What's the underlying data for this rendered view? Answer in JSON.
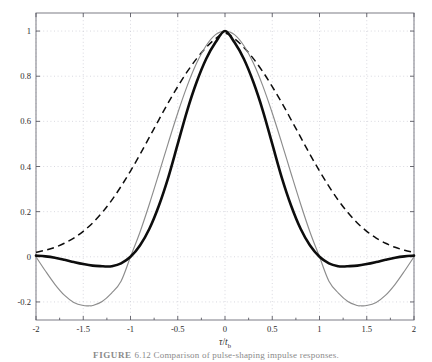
{
  "figure": {
    "caption_prefix": "FIGURE",
    "caption_number": "6.12",
    "caption_text": "Comparison of pulse-shaping impulse responses."
  },
  "axes": {
    "x_title_numerator": "τ",
    "x_title_slash": "/",
    "x_title_denominator": "t",
    "x_title_subscript": "b",
    "y_title": ""
  },
  "chart_data": {
    "type": "line",
    "title": "",
    "xlabel": "τ/t_b",
    "ylabel": "",
    "xlim": [
      -2,
      2
    ],
    "ylim": [
      -0.28,
      1.08
    ],
    "xticks": [
      -2,
      -1.5,
      -1,
      -0.5,
      0,
      0.5,
      1,
      1.5,
      2
    ],
    "xticklabels": [
      "-2",
      "-1.5",
      "-1",
      "-0.5",
      "0",
      "0.5",
      "1",
      "1.5",
      "2"
    ],
    "yticks": [
      -0.2,
      0,
      0.2,
      0.4,
      0.6,
      0.8,
      1
    ],
    "yticklabels": [
      "-0.2",
      "0",
      "0.2",
      "0.4",
      "0.6",
      "0.8",
      "1"
    ],
    "grid": true,
    "grid_style": "dotted",
    "legend": "none",
    "series": [
      {
        "name": "sinc-pulse-thin-gray",
        "style": "thin solid gray",
        "color": "#8c8c8c",
        "x": [
          -2,
          -1.9,
          -1.8,
          -1.7,
          -1.6,
          -1.5,
          -1.43,
          -1.4,
          -1.3,
          -1.2,
          -1.1,
          -1,
          -0.9,
          -0.8,
          -0.7,
          -0.6,
          -0.5,
          -0.4,
          -0.3,
          -0.2,
          -0.1,
          0,
          0.1,
          0.2,
          0.3,
          0.4,
          0.5,
          0.6,
          0.7,
          0.8,
          0.9,
          1,
          1.1,
          1.2,
          1.3,
          1.4,
          1.43,
          1.5,
          1.6,
          1.7,
          1.8,
          1.9,
          2
        ],
        "y": [
          0,
          -0.063,
          -0.122,
          -0.17,
          -0.202,
          -0.216,
          -0.217,
          -0.216,
          -0.198,
          -0.161,
          -0.108,
          0,
          0.109,
          0.234,
          0.368,
          0.505,
          0.637,
          0.757,
          0.858,
          0.935,
          0.984,
          1,
          0.984,
          0.935,
          0.858,
          0.757,
          0.637,
          0.505,
          0.368,
          0.234,
          0.109,
          0,
          -0.108,
          -0.161,
          -0.198,
          -0.216,
          -0.217,
          -0.216,
          -0.202,
          -0.17,
          -0.122,
          -0.063,
          0
        ]
      },
      {
        "name": "raised-cosine-thick-black",
        "style": "thick solid black",
        "color": "#0d0d0d",
        "x": [
          -2,
          -1.9,
          -1.8,
          -1.7,
          -1.6,
          -1.5,
          -1.4,
          -1.3,
          -1.25,
          -1.2,
          -1.1,
          -1,
          -0.9,
          -0.8,
          -0.7,
          -0.6,
          -0.5,
          -0.4,
          -0.3,
          -0.2,
          -0.1,
          0,
          0.1,
          0.2,
          0.3,
          0.4,
          0.5,
          0.6,
          0.7,
          0.8,
          0.9,
          1,
          1.1,
          1.2,
          1.25,
          1.3,
          1.4,
          1.5,
          1.6,
          1.7,
          1.8,
          1.9,
          2
        ],
        "y": [
          0.005,
          0.002,
          -0.004,
          -0.013,
          -0.023,
          -0.032,
          -0.039,
          -0.042,
          -0.043,
          -0.042,
          -0.029,
          0,
          0.05,
          0.124,
          0.226,
          0.352,
          0.5,
          0.648,
          0.774,
          0.876,
          0.95,
          1,
          0.95,
          0.876,
          0.774,
          0.648,
          0.5,
          0.352,
          0.226,
          0.124,
          0.05,
          0,
          -0.029,
          -0.042,
          -0.043,
          -0.042,
          -0.039,
          -0.032,
          -0.023,
          -0.013,
          -0.004,
          0.002,
          0.005
        ]
      },
      {
        "name": "gaussian-wide-dashed",
        "style": "dashed black",
        "color": "#0d0d0d",
        "x": [
          -2,
          -1.9,
          -1.8,
          -1.7,
          -1.6,
          -1.5,
          -1.4,
          -1.3,
          -1.2,
          -1.1,
          -1,
          -0.9,
          -0.8,
          -0.7,
          -0.6,
          -0.5,
          -0.4,
          -0.3,
          -0.2,
          -0.1,
          0,
          0.1,
          0.2,
          0.3,
          0.4,
          0.5,
          0.6,
          0.7,
          0.8,
          0.9,
          1,
          1.1,
          1.2,
          1.3,
          1.4,
          1.5,
          1.6,
          1.7,
          1.8,
          1.9,
          2
        ],
        "y": [
          0.02,
          0.029,
          0.042,
          0.06,
          0.083,
          0.113,
          0.15,
          0.196,
          0.25,
          0.312,
          0.38,
          0.453,
          0.53,
          0.607,
          0.683,
          0.754,
          0.82,
          0.878,
          0.927,
          0.966,
          0.99,
          0.966,
          0.927,
          0.878,
          0.82,
          0.754,
          0.683,
          0.607,
          0.53,
          0.453,
          0.38,
          0.312,
          0.25,
          0.196,
          0.15,
          0.113,
          0.083,
          0.06,
          0.042,
          0.029,
          0.02
        ]
      }
    ]
  },
  "geometry": {
    "plot_left": 36,
    "plot_right": 414,
    "plot_top": 13,
    "plot_bottom": 320
  }
}
